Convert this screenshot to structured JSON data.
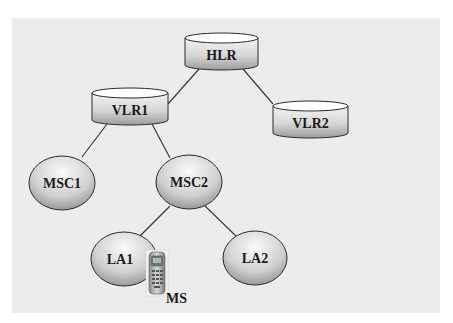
{
  "diagram": {
    "type": "hierarchy",
    "background_color": "#ececec",
    "nodes": {
      "hlr": {
        "label": "HLR",
        "shape": "cylinder"
      },
      "vlr1": {
        "label": "VLR1",
        "shape": "cylinder"
      },
      "vlr2": {
        "label": "VLR2",
        "shape": "cylinder"
      },
      "msc1": {
        "label": "MSC1",
        "shape": "ellipse"
      },
      "msc2": {
        "label": "MSC2",
        "shape": "ellipse"
      },
      "la1": {
        "label": "LA1",
        "shape": "ellipse"
      },
      "la2": {
        "label": "LA2",
        "shape": "ellipse"
      },
      "ms": {
        "label": "MS",
        "shape": "mobile-phone-icon"
      }
    },
    "edges": [
      {
        "from": "HLR",
        "to": "VLR1"
      },
      {
        "from": "HLR",
        "to": "VLR2"
      },
      {
        "from": "VLR1",
        "to": "MSC1"
      },
      {
        "from": "VLR1",
        "to": "MSC2"
      },
      {
        "from": "MSC2",
        "to": "LA1"
      },
      {
        "from": "MSC2",
        "to": "LA2"
      }
    ]
  }
}
